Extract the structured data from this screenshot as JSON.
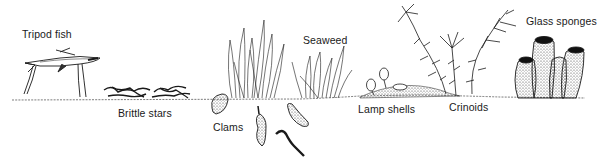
{
  "diagram": {
    "type": "illustration",
    "labels": [
      {
        "id": "tripod-fish",
        "text": "Tripod fish",
        "x": 22,
        "y": 28
      },
      {
        "id": "brittle-stars",
        "text": "Brittle stars",
        "x": 118,
        "y": 107
      },
      {
        "id": "clams",
        "text": "Clams",
        "x": 213,
        "y": 121
      },
      {
        "id": "seaweed",
        "text": "Seaweed",
        "x": 303,
        "y": 34
      },
      {
        "id": "lamp-shells",
        "text": "Lamp shells",
        "x": 358,
        "y": 103
      },
      {
        "id": "crinoids",
        "text": "Crinoids",
        "x": 449,
        "y": 101
      },
      {
        "id": "glass-sponges",
        "text": "Glass sponges",
        "x": 526,
        "y": 15
      }
    ],
    "colors": {
      "ink": "#1a1a1a",
      "background": "#ffffff",
      "stipple": "#555555"
    }
  }
}
